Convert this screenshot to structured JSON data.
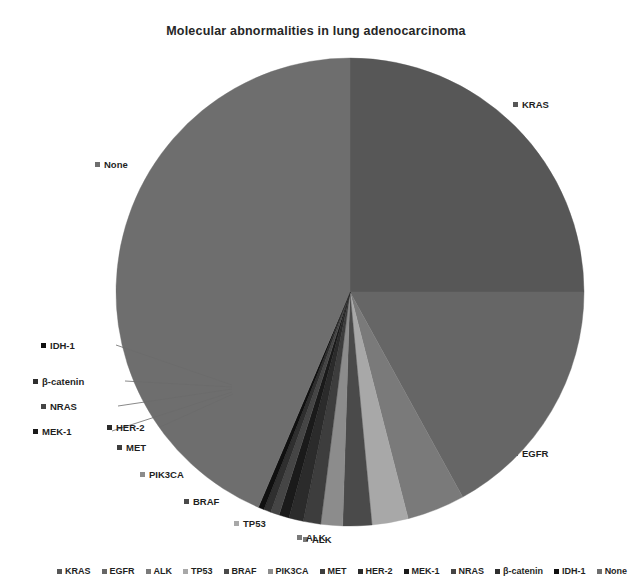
{
  "chart_data": {
    "type": "pie",
    "title": "Molecular abnormalities in lung adenocarcinoma",
    "xlabel": "",
    "ylabel": "",
    "legend_position": "bottom",
    "grid": false,
    "start_angle_deg": 0,
    "direction": "clockwise",
    "categories": [
      "KRAS",
      "EGFR",
      "ALK",
      "TP53",
      "BRAF",
      "PIK3CA",
      "MET",
      "HER-2",
      "MEK-1",
      "NRAS",
      "β-catenin",
      "IDH-1",
      "None"
    ],
    "values": [
      25.0,
      17.0,
      4.0,
      2.5,
      2.0,
      1.5,
      1.2,
      1.0,
      0.7,
      0.6,
      0.5,
      0.4,
      43.6
    ],
    "colors": [
      "#575757",
      "#666666",
      "#7a7a7a",
      "#a8a8a8",
      "#4a4a4a",
      "#8c8c8c",
      "#3d3d3d",
      "#2b2b2b",
      "#1a1a1a",
      "#454545",
      "#2f2f2f",
      "#101010",
      "#6e6e6e"
    ],
    "slices": [
      {
        "label": "KRAS",
        "value": 25.0,
        "color": "#575757"
      },
      {
        "label": "EGFR",
        "value": 17.0,
        "color": "#666666"
      },
      {
        "label": "ALK",
        "value": 4.0,
        "color": "#7a7a7a"
      },
      {
        "label": "TP53",
        "value": 2.5,
        "color": "#a8a8a8"
      },
      {
        "label": "BRAF",
        "value": 2.0,
        "color": "#4a4a4a"
      },
      {
        "label": "PIK3CA",
        "value": 1.5,
        "color": "#8c8c8c"
      },
      {
        "label": "MET",
        "value": 1.2,
        "color": "#3d3d3d"
      },
      {
        "label": "HER-2",
        "value": 1.0,
        "color": "#2b2b2b"
      },
      {
        "label": "MEK-1",
        "value": 0.7,
        "color": "#1a1a1a"
      },
      {
        "label": "NRAS",
        "value": 0.6,
        "color": "#454545"
      },
      {
        "label": "β-catenin",
        "value": 0.5,
        "color": "#2f2f2f"
      },
      {
        "label": "IDH-1",
        "value": 0.4,
        "color": "#101010"
      },
      {
        "label": "None",
        "value": 43.6,
        "color": "#6e6e6e"
      }
    ]
  },
  "callouts": [
    {
      "label": "KRAS",
      "color": "#575757"
    },
    {
      "label": "None",
      "color": "#6e6e6e"
    },
    {
      "label": "IDH-1",
      "color": "#101010"
    },
    {
      "label": "β-catenin",
      "color": "#2f2f2f"
    },
    {
      "label": "NRAS",
      "color": "#454545"
    },
    {
      "label": "MEK-1",
      "color": "#1a1a1a"
    },
    {
      "label": "HER-2",
      "color": "#2b2b2b"
    },
    {
      "label": "MET",
      "color": "#3d3d3d"
    },
    {
      "label": "PIK3CA",
      "color": "#8c8c8c"
    },
    {
      "label": "BRAF",
      "color": "#4a4a4a"
    },
    {
      "label": "TP53",
      "color": "#a8a8a8"
    },
    {
      "label": "ALK",
      "color": "#7a7a7a"
    },
    {
      "label": "EGFR",
      "color": "#666666"
    }
  ],
  "legend": {
    "items": [
      {
        "label": "KRAS",
        "color": "#575757"
      },
      {
        "label": "EGFR",
        "color": "#666666"
      },
      {
        "label": "ALK",
        "color": "#7a7a7a"
      },
      {
        "label": "TP53",
        "color": "#a8a8a8"
      },
      {
        "label": "BRAF",
        "color": "#4a4a4a"
      },
      {
        "label": "PIK3CA",
        "color": "#8c8c8c"
      },
      {
        "label": "MET",
        "color": "#3d3d3d"
      },
      {
        "label": "HER-2",
        "color": "#2b2b2b"
      },
      {
        "label": "MEK-1",
        "color": "#1a1a1a"
      },
      {
        "label": "NRAS",
        "color": "#454545"
      },
      {
        "label": "β-catenin",
        "color": "#2f2f2f"
      },
      {
        "label": "IDH-1",
        "color": "#101010"
      },
      {
        "label": "None",
        "color": "#6e6e6e"
      }
    ],
    "fragment": {
      "label": "ALK",
      "color": "#7a7a7a"
    }
  }
}
